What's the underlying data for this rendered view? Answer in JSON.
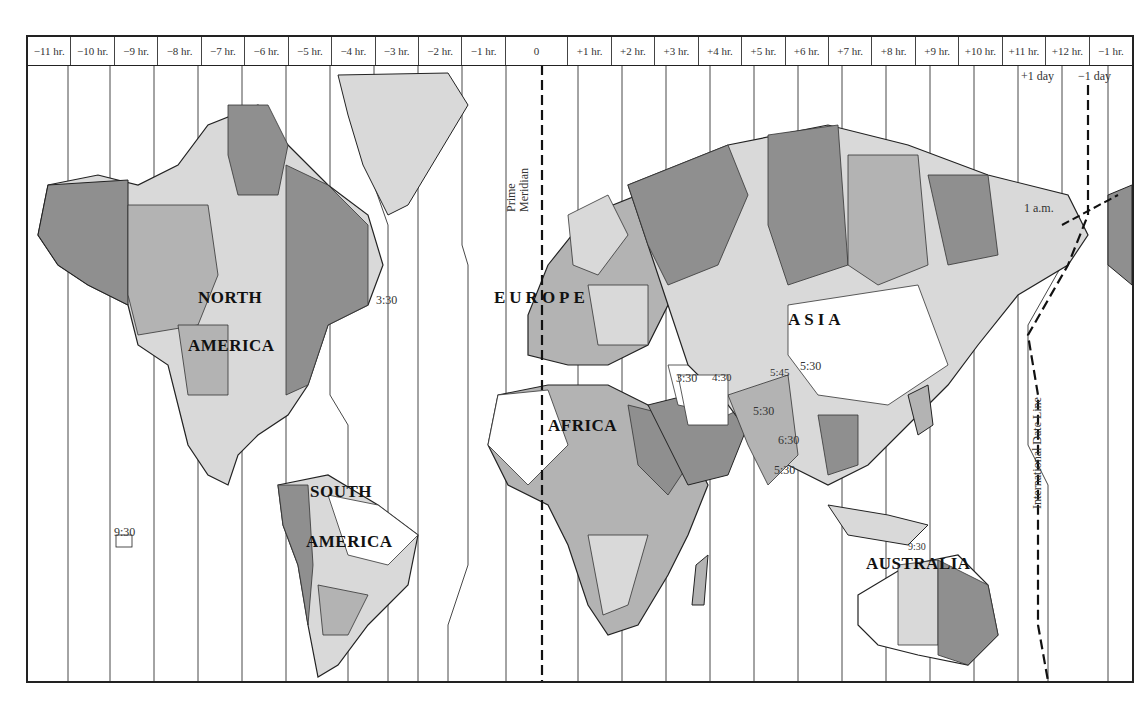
{
  "map": {
    "title_cut": "",
    "zones": [
      {
        "label": "−11 hr.",
        "offset": -11
      },
      {
        "label": "−10 hr.",
        "offset": -10
      },
      {
        "label": "−9 hr.",
        "offset": -9
      },
      {
        "label": "−8 hr.",
        "offset": -8
      },
      {
        "label": "−7 hr.",
        "offset": -7
      },
      {
        "label": "−6 hr.",
        "offset": -6
      },
      {
        "label": "−5 hr.",
        "offset": -5
      },
      {
        "label": "−4 hr.",
        "offset": -4
      },
      {
        "label": "−3 hr.",
        "offset": -3
      },
      {
        "label": "−2 hr.",
        "offset": -2
      },
      {
        "label": "−1 hr.",
        "offset": -1
      },
      {
        "label": "0",
        "offset": 0
      },
      {
        "label": "+1 hr.",
        "offset": 1
      },
      {
        "label": "+2 hr.",
        "offset": 2
      },
      {
        "label": "+3 hr.",
        "offset": 3
      },
      {
        "label": "+4 hr.",
        "offset": 4
      },
      {
        "label": "+5 hr.",
        "offset": 5
      },
      {
        "label": "+6 hr.",
        "offset": 6
      },
      {
        "label": "+7 hr.",
        "offset": 7
      },
      {
        "label": "+8 hr.",
        "offset": 8
      },
      {
        "label": "+9 hr.",
        "offset": 9
      },
      {
        "label": "+10 hr.",
        "offset": 10
      },
      {
        "label": "+11 hr.",
        "offset": 11
      },
      {
        "label": "+12 hr.",
        "offset": 12
      },
      {
        "label": "−1 hr.",
        "offset": -1
      }
    ],
    "date_labels": {
      "plus_day": "+1 day",
      "minus_day": "−1 day"
    },
    "lines": {
      "prime_meridian": "Prime Meridian",
      "prime_1": "Prime",
      "prime_2": "Meridian",
      "date_line": "International Date Line"
    },
    "continents": {
      "north_1": "NORTH",
      "north_2": "AMERICA",
      "south_1": "SOUTH",
      "south_2": "AMERICA",
      "europe": "EUROPE",
      "africa": "AFRICA",
      "asia": "ASIA",
      "australia": "AUSTRALIA"
    },
    "offset_notes": {
      "newfoundland": "3:30",
      "iran": "3:30",
      "afghanistan": "4:30",
      "nepal": "5:45",
      "india": "5:30",
      "india_east": "5:30",
      "myanmar": "6:30",
      "sri_lanka": "5:30",
      "marquesas": "9:30",
      "central_australia": "9:30",
      "one_am": "1 a.m."
    },
    "colors": {
      "dark": "#8f8f8f",
      "mid": "#b3b3b3",
      "light": "#d9d9d9",
      "white": "#ffffff",
      "line": "#222222"
    }
  }
}
